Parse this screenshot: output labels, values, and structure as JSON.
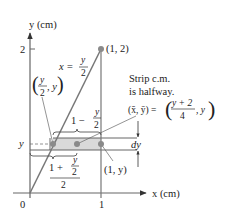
{
  "figure": {
    "axes": {
      "y_label": "y (cm)",
      "x_label": "x (cm)",
      "origin_label": "0",
      "x_tick_label": "1",
      "y_tick_label": "2",
      "strip_y_label": "y"
    },
    "curve": {
      "equation_lhs": "x =",
      "equation_num": "y",
      "equation_den": "2"
    },
    "points": {
      "top": "(1, 2)",
      "left_num": "y",
      "left_den": "2",
      "left_suffix": ", y",
      "right": "(1, y)"
    },
    "annotations": {
      "note_line1": "Strip c.m.",
      "note_line2": "is halfway.",
      "centroid_lhs": "(x̄, ȳ) =",
      "centroid_num": "y + 2",
      "centroid_den": "4",
      "centroid_suffix": ", y",
      "length_prefix": "1 −",
      "length_num": "y",
      "length_den": "2",
      "mid_prefix": "1 +",
      "mid_num": "y",
      "mid_den": "2",
      "mid_outer_den": "2",
      "dy_label": "dy"
    },
    "colors": {
      "line": "#777777",
      "strip_fill": "#d9d9d9",
      "point": "#8a8a8a",
      "text": "#222222"
    }
  }
}
